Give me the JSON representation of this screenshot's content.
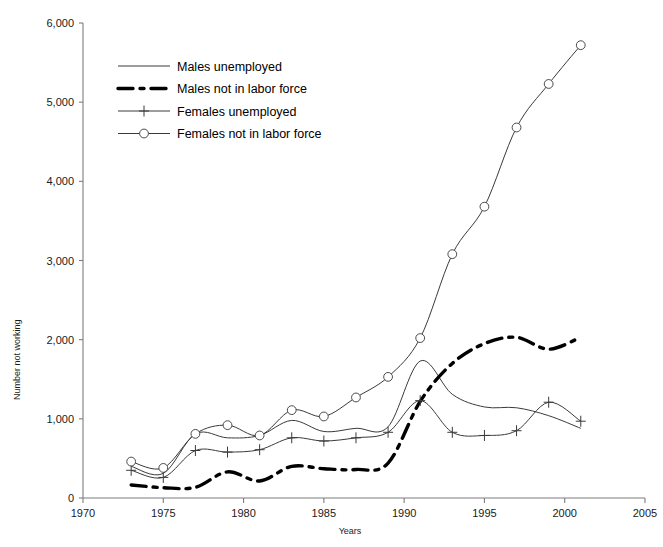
{
  "chart_data": {
    "type": "line",
    "title": "",
    "xlabel": "Years",
    "ylabel": "Number not working",
    "xlim": [
      1970,
      2005
    ],
    "ylim": [
      0,
      6000
    ],
    "grid": false,
    "legend_position": "upper-left-inside",
    "x_tick_labels": [
      "1970",
      "1975",
      "1980",
      "1985",
      "1990",
      "1995",
      "2000",
      "2005"
    ],
    "x_ticks": [
      1970,
      1975,
      1980,
      1985,
      1990,
      1995,
      2000,
      2005
    ],
    "y_tick_labels": [
      "0",
      "1,000",
      "2,000",
      "3,000",
      "4,000",
      "5,000",
      "6,000"
    ],
    "y_ticks": [
      0,
      1000,
      2000,
      3000,
      4000,
      5000,
      6000
    ],
    "x": [
      1973,
      1975,
      1977,
      1979,
      1981,
      1983,
      1985,
      1987,
      1989,
      1991,
      1993,
      1995,
      1997,
      1999,
      2001
    ],
    "series": [
      {
        "name": "Males unemployed",
        "marker": "none",
        "line": "solid-thin",
        "values": [
          400,
          310,
          810,
          760,
          790,
          980,
          840,
          880,
          900,
          1730,
          1310,
          1150,
          1140,
          1040,
          880
        ]
      },
      {
        "name": "Males not in labor force",
        "marker": "none",
        "line": "dash-dot-thick",
        "values": [
          165,
          130,
          135,
          330,
          215,
          400,
          370,
          360,
          440,
          1220,
          1700,
          1950,
          2030,
          1880,
          2030
        ]
      },
      {
        "name": "Females unemployed",
        "marker": "plus",
        "line": "solid-thin",
        "values": [
          350,
          260,
          600,
          580,
          610,
          760,
          720,
          760,
          830,
          1230,
          830,
          790,
          850,
          1210,
          970
        ]
      },
      {
        "name": "Females not in labor force",
        "marker": "circle",
        "line": "solid-thin",
        "values": [
          460,
          380,
          810,
          920,
          790,
          1110,
          1030,
          1270,
          1530,
          2020,
          3080,
          3680,
          4680,
          5230,
          5720
        ]
      }
    ]
  },
  "legend": {
    "items": [
      {
        "label": "Males unemployed",
        "key": "males-unemployed"
      },
      {
        "label": "Males not in labor force",
        "key": "males-not-in-labor-force"
      },
      {
        "label": "Females unemployed",
        "key": "females-unemployed"
      },
      {
        "label": "Females not in labor force",
        "key": "females-not-in-labor-force"
      }
    ]
  }
}
